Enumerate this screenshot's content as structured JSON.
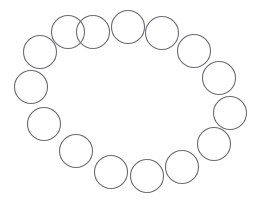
{
  "figure": {
    "type": "shape-arrangement",
    "background_color": "#ffffff",
    "canvas": {
      "width": 260,
      "height": 201
    },
    "arrangement": {
      "pattern": "elliptical-ring",
      "center_x": 131,
      "center_y": 100,
      "radius_x": 100,
      "radius_y": 73,
      "count": 15,
      "start_angle_deg": -90
    },
    "circle_style": {
      "stroke_color": "#6b6b72",
      "stroke_width": 1.1,
      "fill": "none",
      "diameter": 33,
      "radius": 16.5
    },
    "circles": [
      {
        "id": "circle-1",
        "cx": 128,
        "cy": 27,
        "r": 16.5
      },
      {
        "id": "circle-2",
        "cx": 162,
        "cy": 33,
        "r": 16.5
      },
      {
        "id": "circle-3",
        "cx": 194,
        "cy": 51,
        "r": 16.5
      },
      {
        "id": "circle-4",
        "cx": 219,
        "cy": 78,
        "r": 16.5
      },
      {
        "id": "circle-5",
        "cx": 230,
        "cy": 113,
        "r": 16.5
      },
      {
        "id": "circle-6",
        "cx": 214,
        "cy": 144,
        "r": 16.5
      },
      {
        "id": "circle-7",
        "cx": 182,
        "cy": 167,
        "r": 16.5
      },
      {
        "id": "circle-8",
        "cx": 147,
        "cy": 176,
        "r": 16.5
      },
      {
        "id": "circle-9",
        "cx": 111,
        "cy": 172,
        "r": 16.5
      },
      {
        "id": "circle-10",
        "cx": 76,
        "cy": 151,
        "r": 16.5
      },
      {
        "id": "circle-11",
        "cx": 44,
        "cy": 124,
        "r": 16.5
      },
      {
        "id": "circle-12",
        "cx": 31,
        "cy": 87,
        "r": 16.5
      },
      {
        "id": "circle-13",
        "cx": 40,
        "cy": 52,
        "r": 16.5
      },
      {
        "id": "circle-14",
        "cx": 68,
        "cy": 32,
        "r": 16.5
      },
      {
        "id": "circle-15",
        "cx": 93,
        "cy": 32,
        "r": 16.5
      }
    ]
  }
}
